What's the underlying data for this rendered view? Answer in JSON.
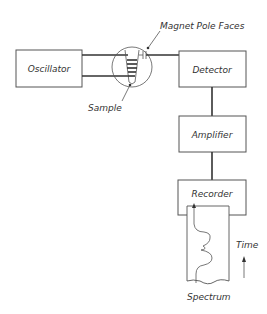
{
  "diagram": {
    "blocks": [
      {
        "id": "oscillator",
        "label": "Oscillator"
      },
      {
        "id": "detector",
        "label": "Detector"
      },
      {
        "id": "amplifier",
        "label": "Amplifier"
      },
      {
        "id": "recorder",
        "label": "Recorder"
      }
    ],
    "annotations": {
      "magnet": "Magnet Pole Faces",
      "sample": "Sample",
      "time": "Time",
      "spectrum": "Spectrum"
    },
    "connections": [
      {
        "from": "oscillator",
        "to": "sample-coil"
      },
      {
        "from": "sample-coil",
        "to": "detector"
      },
      {
        "from": "detector",
        "to": "amplifier"
      },
      {
        "from": "amplifier",
        "to": "recorder"
      }
    ],
    "colors": {
      "line": "#333333",
      "background": "#ffffff"
    }
  }
}
